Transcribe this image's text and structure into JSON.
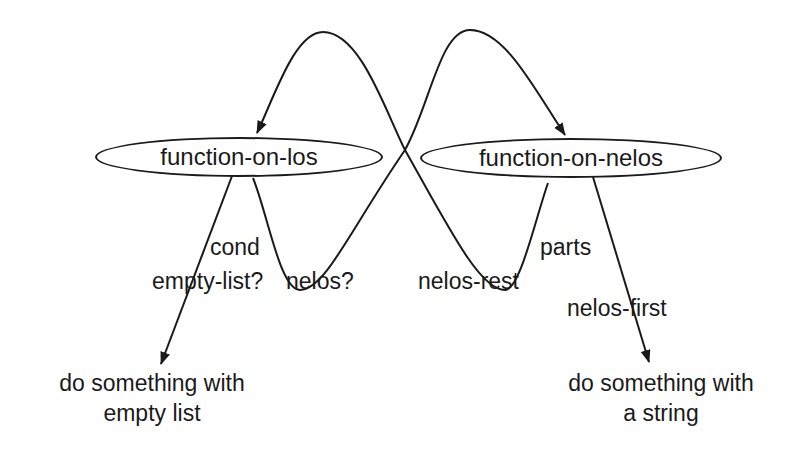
{
  "diagram": {
    "nodes": [
      {
        "id": "los",
        "label": "function-on-los"
      },
      {
        "id": "nelos",
        "label": "function-on-nelos"
      }
    ],
    "edge_labels": {
      "cond": "cond",
      "empty_list_q": "empty-list?",
      "nelos_q": "nelos?",
      "nelos_rest": "nelos-rest",
      "parts": "parts",
      "nelos_first": "nelos-first"
    },
    "terminals": {
      "empty": {
        "line1": "do something with",
        "line2": "empty list"
      },
      "string": {
        "line1": "do something with",
        "line2": "a string"
      }
    },
    "edges": [
      {
        "from": "los",
        "to": "nelos",
        "via": "nelos?",
        "style": "curved-arrow"
      },
      {
        "from": "nelos",
        "to": "los",
        "via": "nelos-rest",
        "style": "curved-arrow"
      },
      {
        "from": "los",
        "to": "empty",
        "via": "cond empty-list?",
        "style": "arrow"
      },
      {
        "from": "nelos",
        "to": "string",
        "via": "parts nelos-first",
        "style": "arrow"
      }
    ],
    "colors": {
      "stroke": "#1a1a1a",
      "background": "#ffffff"
    }
  }
}
